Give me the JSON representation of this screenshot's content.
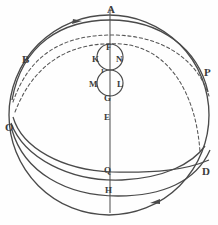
{
  "figure": {
    "width": 218,
    "height": 225,
    "background_color": "#fefefe",
    "ink_color": "#4a4a4a",
    "label_color": "#3b3b3b"
  },
  "labels": [
    {
      "id": "A",
      "text": "A",
      "x": 107,
      "y": 4,
      "size": "major",
      "role": "north-pole-point"
    },
    {
      "id": "B",
      "text": "B",
      "x": 22,
      "y": 54,
      "size": "major",
      "role": "upper-left-point"
    },
    {
      "id": "P",
      "text": "P",
      "x": 204,
      "y": 67,
      "size": "major",
      "role": "right-point"
    },
    {
      "id": "O",
      "text": "O",
      "x": 5,
      "y": 122,
      "size": "major",
      "role": "left-point"
    },
    {
      "id": "D",
      "text": "D",
      "x": 202,
      "y": 166,
      "size": "major",
      "role": "lower-right-point"
    },
    {
      "id": "F",
      "text": "F",
      "x": 106,
      "y": 43,
      "size": "minor",
      "role": "upper-circle-top"
    },
    {
      "id": "K",
      "text": "K",
      "x": 92,
      "y": 55,
      "size": "minor",
      "role": "upper-circle-left"
    },
    {
      "id": "N",
      "text": "N",
      "x": 116,
      "y": 55,
      "size": "minor",
      "role": "upper-circle-right"
    },
    {
      "id": "I",
      "text": "I",
      "x": 101,
      "y": 68,
      "size": "tiny",
      "role": "circles-tangency"
    },
    {
      "id": "M",
      "text": "M",
      "x": 91,
      "y": 80,
      "size": "minor",
      "role": "lower-circle-left"
    },
    {
      "id": "L",
      "text": "L",
      "x": 117,
      "y": 80,
      "size": "minor",
      "role": "lower-circle-right"
    },
    {
      "id": "G",
      "text": "G",
      "x": 104,
      "y": 94,
      "size": "minor",
      "role": "lower-circle-bottom"
    },
    {
      "id": "E",
      "text": "E",
      "x": 104,
      "y": 113,
      "size": "minor",
      "role": "center-axis-point"
    },
    {
      "id": "Q",
      "text": "Q",
      "x": 104,
      "y": 166,
      "size": "minor",
      "role": "lower-axis-point"
    },
    {
      "id": "H",
      "text": "H",
      "x": 105,
      "y": 186,
      "size": "minor",
      "role": "south-axis-point"
    }
  ],
  "shapes": {
    "main_sphere": {
      "name": "main-circle",
      "cx": 109,
      "cy": 115,
      "r": 100,
      "style": "solid"
    },
    "vertical_axis": {
      "name": "vertical-axis",
      "x": 110,
      "y1": 8,
      "y2": 213,
      "style": "solid"
    },
    "upper_small_circle": {
      "name": "upper-small-circle",
      "cx": 110,
      "cy": 57,
      "r": 13,
      "style": "solid"
    },
    "lower_small_circle": {
      "name": "lower-small-circle",
      "cx": 110,
      "cy": 83,
      "r": 13,
      "style": "solid"
    },
    "dashed_arcs": [
      {
        "name": "dashed-arc-upper",
        "style": "dashed"
      },
      {
        "name": "dashed-arc-lower",
        "style": "dashed"
      }
    ],
    "solid_arcs": [
      {
        "name": "solid-arc-b-to-p",
        "style": "solid"
      },
      {
        "name": "solid-arc-o-to-d",
        "style": "solid"
      },
      {
        "name": "solid-arc-o-to-q",
        "style": "solid"
      },
      {
        "name": "solid-arc-bottom",
        "style": "solid"
      }
    ],
    "arrowheads": [
      {
        "name": "arrowhead-top",
        "x": 77,
        "y": 22,
        "direction": "right"
      },
      {
        "name": "arrowhead-bottom",
        "x": 155,
        "y": 202,
        "direction": "left"
      }
    ]
  }
}
